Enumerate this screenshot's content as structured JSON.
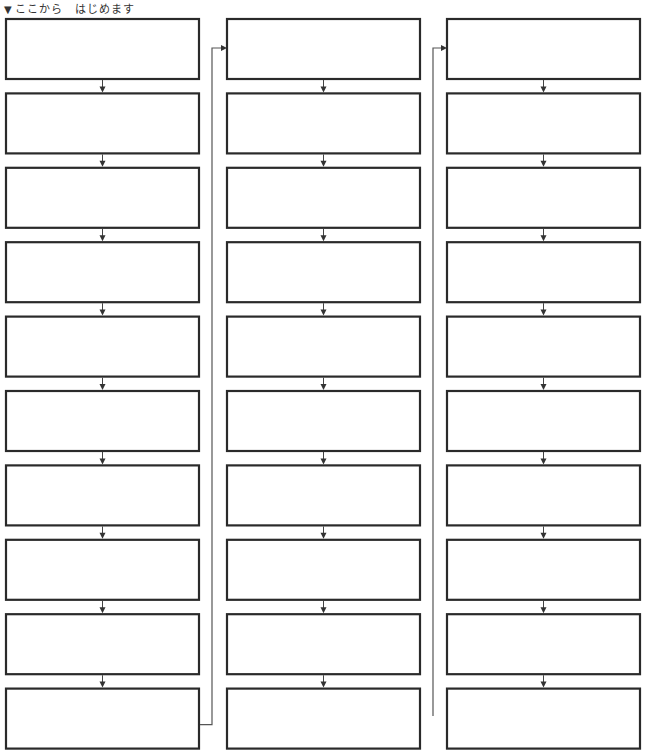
{
  "header": {
    "marker": "▼",
    "text": "ここから　はじめます"
  },
  "diagram": {
    "columns": 3,
    "rows_per_column": 10,
    "box_color": "#2a2a2a",
    "connector_color": "#555555",
    "boxes_text": [
      [
        "",
        "",
        "",
        "",
        "",
        "",
        "",
        "",
        "",
        ""
      ],
      [
        "",
        "",
        "",
        "",
        "",
        "",
        "",
        "",
        "",
        ""
      ],
      [
        "",
        "",
        "",
        "",
        "",
        "",
        "",
        "",
        "",
        ""
      ]
    ]
  }
}
